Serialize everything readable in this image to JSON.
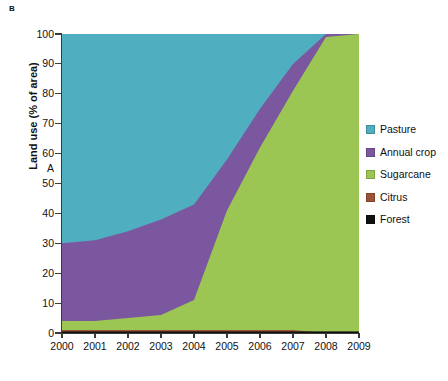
{
  "panel": {
    "letter": "B"
  },
  "axis": {
    "y_title": "Land use (% of area)",
    "stray_label": "A",
    "y_ticks": [
      "100",
      "90",
      "80",
      "70",
      "60",
      "50",
      "40",
      "30",
      "20",
      "10",
      "0"
    ],
    "x_ticks": [
      "2000",
      "2001",
      "2002",
      "2003",
      "2004",
      "2005",
      "2006",
      "2007",
      "2008",
      "2009"
    ]
  },
  "legend": {
    "items": [
      {
        "label": "Pasture",
        "color": "#4FAEC0"
      },
      {
        "label": "Annual crop",
        "color": "#7B57A0"
      },
      {
        "label": "Sugarcane",
        "color": "#9CC653"
      },
      {
        "label": "Citrus",
        "color": "#9B5436"
      },
      {
        "label": "Forest",
        "color": "#111111"
      }
    ]
  },
  "caption": {
    "text": ""
  },
  "chart_data": {
    "type": "area",
    "title": "",
    "subtitle": "",
    "xlabel": "",
    "ylabel": "Land use (% of area)",
    "xlim": [
      2000,
      2009
    ],
    "ylim": [
      0,
      100
    ],
    "grid": false,
    "stacked": true,
    "stack_order_bottom_to_top": [
      "Forest",
      "Citrus",
      "Sugarcane",
      "Annual crop",
      "Pasture"
    ],
    "legend_position": "right",
    "x": [
      2000,
      2001,
      2002,
      2003,
      2004,
      2005,
      2006,
      2007,
      2008,
      2009
    ],
    "categories": [
      "2000",
      "2001",
      "2002",
      "2003",
      "2004",
      "2005",
      "2006",
      "2007",
      "2008",
      "2009"
    ],
    "series": [
      {
        "name": "Pasture",
        "color": "#4FAEC0",
        "values": [
          70,
          69,
          66,
          62,
          57,
          42,
          25,
          10,
          0,
          0
        ]
      },
      {
        "name": "Annual crop",
        "color": "#7B57A0",
        "values": [
          26,
          27,
          29,
          32,
          32,
          17,
          13,
          9,
          1,
          0
        ]
      },
      {
        "name": "Sugarcane",
        "color": "#9CC653",
        "values": [
          3,
          3,
          4,
          5,
          10,
          40,
          61,
          80,
          99,
          100
        ]
      },
      {
        "name": "Citrus",
        "color": "#9B5436",
        "values": [
          1,
          1,
          1,
          1,
          1,
          1,
          1,
          1,
          0,
          0
        ]
      },
      {
        "name": "Forest",
        "color": "#111111",
        "values": [
          0,
          0,
          0,
          0,
          0,
          0,
          0,
          0,
          0,
          0
        ]
      }
    ],
    "cumulative_top_boundaries": {
      "Forest": [
        0,
        0,
        0,
        0,
        0,
        0,
        0,
        0,
        0,
        0
      ],
      "Citrus": [
        1,
        1,
        1,
        1,
        1,
        1,
        1,
        1,
        0,
        0
      ],
      "Sugarcane": [
        4,
        4,
        5,
        6,
        11,
        41,
        62,
        81,
        99,
        100
      ],
      "Annual crop": [
        30,
        31,
        34,
        38,
        43,
        58,
        75,
        90,
        100,
        100
      ],
      "Pasture": [
        100,
        100,
        100,
        100,
        100,
        100,
        100,
        100,
        100,
        100
      ]
    }
  }
}
